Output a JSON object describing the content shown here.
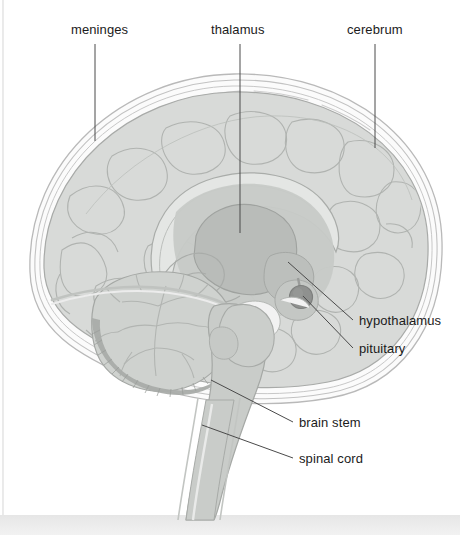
{
  "figure": {
    "type": "anatomical-diagram",
    "orientation": "facing right",
    "style": "grayscale line-and-wash illustration",
    "background_color": "#ffffff",
    "canvas": {
      "width": 460,
      "height": 535
    }
  },
  "palette": {
    "outline": "#9a9a9a",
    "leader_line": "#4a4a4a",
    "label_text": "#1b1b1b",
    "meninges_fill": "#f4f4f4",
    "cortex_fill": "#d8dad8",
    "cortex_inner": "#cfd2cf",
    "corpus_callosum": "#dcdedc",
    "thalamus_fill": "#b9bcb9",
    "midbrain_fill": "#c4c7c4",
    "hypothalamus_fill": "#c0c3c0",
    "pituitary_fill": "#8f918f",
    "cerebellum_fill": "#cfd2cf",
    "cerebellum_shadow": "#a9aca9",
    "brainstem_fill": "#c9ccc9",
    "spinal_cord_fill": "#c9ccc9",
    "base_band": "#ededed"
  },
  "labels": [
    {
      "id": "meninges",
      "text": "meninges",
      "x": 71,
      "y": 22,
      "anchor": "start",
      "leader": {
        "x1": 95,
        "y1": 44,
        "x2": 95,
        "y2": 141
      }
    },
    {
      "id": "thalamus",
      "text": "thalamus",
      "x": 211,
      "y": 22,
      "anchor": "start",
      "leader": {
        "x1": 240,
        "y1": 44,
        "x2": 240,
        "y2": 233
      }
    },
    {
      "id": "cerebrum",
      "text": "cerebrum",
      "x": 347,
      "y": 22,
      "anchor": "start",
      "leader": {
        "x1": 375,
        "y1": 44,
        "x2": 375,
        "y2": 148
      }
    },
    {
      "id": "hypothalamus",
      "text": "hypothalamus",
      "x": 359,
      "y": 313,
      "anchor": "start",
      "leader": {
        "x1": 353,
        "y1": 320,
        "x2": 288,
        "y2": 262
      }
    },
    {
      "id": "pituitary",
      "text": "pituitary",
      "x": 359,
      "y": 341,
      "anchor": "start",
      "leader": {
        "x1": 353,
        "y1": 348,
        "x2": 303,
        "y2": 296
      }
    },
    {
      "id": "brain-stem",
      "text": "brain stem",
      "x": 299,
      "y": 415,
      "anchor": "start",
      "leader": {
        "x1": 293,
        "y1": 422,
        "x2": 211,
        "y2": 380
      }
    },
    {
      "id": "spinal-cord",
      "text": "spinal cord",
      "x": 299,
      "y": 451,
      "anchor": "start",
      "leader": {
        "x1": 293,
        "y1": 458,
        "x2": 202,
        "y2": 425
      }
    }
  ],
  "structures": [
    {
      "id": "meninges",
      "name": "meninges",
      "note": "three concentric membrane layers wrapping the cerebrum"
    },
    {
      "id": "cerebrum",
      "name": "cerebrum",
      "note": "large convoluted hemisphere with gyri and sulci"
    },
    {
      "id": "corpus-callosum",
      "name": "corpus callosum",
      "note": "pale arching band above the thalamus"
    },
    {
      "id": "thalamus",
      "name": "thalamus",
      "note": "central ovoid mass, darker gray"
    },
    {
      "id": "hypothalamus",
      "name": "hypothalamus",
      "note": "region below and in front of the thalamus"
    },
    {
      "id": "pituitary",
      "name": "pituitary",
      "note": "small dark round gland on a short stalk"
    },
    {
      "id": "cerebellum",
      "name": "cerebellum",
      "note": "lower posterior mass with arbor vitae branching"
    },
    {
      "id": "brain-stem",
      "name": "brain stem",
      "note": "midbrain, pons and medulla descending column"
    },
    {
      "id": "spinal-cord",
      "name": "spinal cord",
      "note": "continues downward past the skull base"
    }
  ]
}
